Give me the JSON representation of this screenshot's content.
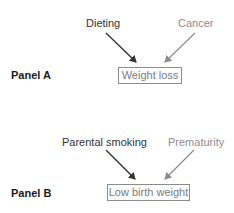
{
  "panels": [
    {
      "label": "Panel A",
      "cause_primary": "Dieting",
      "cause_secondary": "Cancer",
      "outcome": "Weight loss"
    },
    {
      "label": "Panel B",
      "cause_primary": "Parental smoking",
      "cause_secondary": "Prematurity",
      "outcome": "Low birth weight"
    }
  ],
  "colors": {
    "primary_arrow": "#333333",
    "secondary_arrow": "#8c8c8c",
    "box_border": "#8c8c8c"
  }
}
